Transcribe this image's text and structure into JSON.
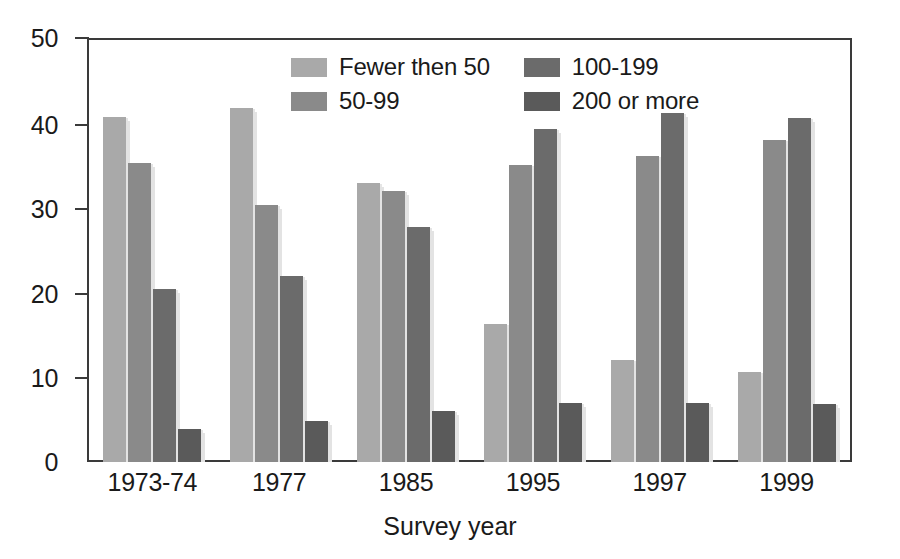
{
  "chart_data": {
    "type": "bar",
    "title": "",
    "subtitle": "",
    "xlabel": "Survey year",
    "ylabel": "",
    "categories": [
      "1973-74",
      "1977",
      "1985",
      "1995",
      "1997",
      "1999"
    ],
    "ylim": [
      0,
      50
    ],
    "yticks": [
      0,
      10,
      20,
      30,
      40,
      50
    ],
    "ytick_labels": [
      "0",
      "10",
      "20",
      "30",
      "40",
      "50"
    ],
    "grid": false,
    "legend_position": "inside-top-center",
    "series": [
      {
        "name": "Fewer then 50",
        "color": "#a9a9a9",
        "values": [
          40.9,
          42.0,
          33.0,
          16.4,
          12.1,
          10.7
        ]
      },
      {
        "name": "50-99",
        "color": "#8a8a8a",
        "values": [
          35.4,
          30.5,
          32.1,
          35.2,
          36.3,
          38.1
        ]
      },
      {
        "name": "100-199",
        "color": "#6b6b6b",
        "values": [
          20.5,
          22.0,
          27.8,
          39.5,
          41.4,
          40.8
        ]
      },
      {
        "name": "200 or more",
        "color": "#5a5a5a",
        "values": [
          3.9,
          4.9,
          6.0,
          7.0,
          7.0,
          6.9
        ]
      }
    ]
  },
  "axis": {
    "y_labels": [
      "50",
      "40",
      "30",
      "20",
      "10",
      "0"
    ],
    "x_labels": [
      "1973-74",
      "1977",
      "1985",
      "1995",
      "1997",
      "1999"
    ],
    "x_title": "Survey year"
  },
  "legend": {
    "items": [
      {
        "label": "Fewer then 50",
        "color": "#a9a9a9"
      },
      {
        "label": "100-199",
        "color": "#6b6b6b"
      },
      {
        "label": "50-99",
        "color": "#8a8a8a"
      },
      {
        "label": "200 or more",
        "color": "#5a5a5a"
      }
    ]
  },
  "style": {
    "frame_color": "#3a3a3a",
    "background": "#ffffff",
    "text_color": "#1a1a1a"
  }
}
